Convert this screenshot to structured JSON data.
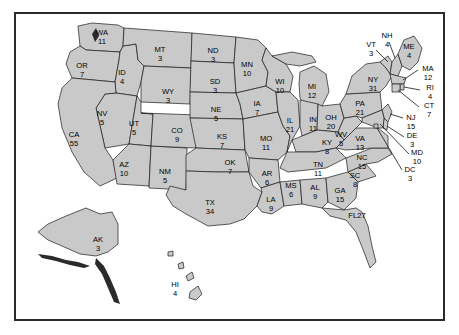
{
  "figure": {
    "frame_color": "#2b2b2b",
    "state_fill_color": "#c9c9c9",
    "state_border_color": "#1a1a1a",
    "background_color": "#ffffff",
    "label_color": "#000000"
  },
  "chart_data": {
    "type": "map",
    "value_label": "Electoral votes",
    "total_electoral_votes": 538,
    "categories": [
      "WA",
      "OR",
      "ID",
      "MT",
      "WY",
      "NV",
      "UT",
      "CA",
      "AZ",
      "NM",
      "CO",
      "ND",
      "SD",
      "NE",
      "KS",
      "OK",
      "TX",
      "MN",
      "IA",
      "MO",
      "AR",
      "LA",
      "WI",
      "IL",
      "MS",
      "AL",
      "MI",
      "IN",
      "OH",
      "KY",
      "TN",
      "GA",
      "FL",
      "SC",
      "NC",
      "VA",
      "WV",
      "PA",
      "NY",
      "VT",
      "NH",
      "ME",
      "MA",
      "RI",
      "CT",
      "NJ",
      "DE",
      "MD",
      "DC",
      "AK",
      "HI"
    ],
    "values": [
      11,
      7,
      4,
      3,
      3,
      5,
      5,
      55,
      10,
      5,
      9,
      3,
      3,
      5,
      7,
      7,
      34,
      10,
      7,
      11,
      6,
      9,
      10,
      21,
      6,
      9,
      12,
      11,
      20,
      8,
      11,
      15,
      27,
      8,
      15,
      13,
      5,
      21,
      31,
      3,
      4,
      4,
      12,
      4,
      7,
      15,
      3,
      10,
      3,
      3,
      4
    ],
    "states": [
      {
        "abbr": "WA",
        "votes": 11,
        "label_x": 102,
        "label_y": 33,
        "leader": false
      },
      {
        "abbr": "OR",
        "votes": 7,
        "label_x": 82,
        "label_y": 66,
        "leader": false
      },
      {
        "abbr": "ID",
        "votes": 4,
        "label_x": 122,
        "label_y": 73,
        "leader": false
      },
      {
        "abbr": "MT",
        "votes": 3,
        "label_x": 160,
        "label_y": 50,
        "leader": false
      },
      {
        "abbr": "WY",
        "votes": 3,
        "label_x": 168,
        "label_y": 92,
        "leader": false
      },
      {
        "abbr": "NV",
        "votes": 5,
        "label_x": 102,
        "label_y": 114,
        "leader": false
      },
      {
        "abbr": "UT",
        "votes": 5,
        "label_x": 134,
        "label_y": 124,
        "leader": false
      },
      {
        "abbr": "CA",
        "votes": 55,
        "label_x": 74,
        "label_y": 135,
        "leader": false
      },
      {
        "abbr": "AZ",
        "votes": 10,
        "label_x": 124,
        "label_y": 165,
        "leader": false
      },
      {
        "abbr": "NM",
        "votes": 5,
        "label_x": 165,
        "label_y": 172,
        "leader": false
      },
      {
        "abbr": "CO",
        "votes": 9,
        "label_x": 177,
        "label_y": 131,
        "leader": false
      },
      {
        "abbr": "ND",
        "votes": 3,
        "label_x": 213,
        "label_y": 51,
        "leader": false
      },
      {
        "abbr": "SD",
        "votes": 3,
        "label_x": 215,
        "label_y": 82,
        "leader": false
      },
      {
        "abbr": "NE",
        "votes": 5,
        "label_x": 216,
        "label_y": 110,
        "leader": false
      },
      {
        "abbr": "KS",
        "votes": 7,
        "label_x": 222,
        "label_y": 137,
        "leader": false
      },
      {
        "abbr": "OK",
        "votes": 7,
        "label_x": 230,
        "label_y": 163,
        "leader": false
      },
      {
        "abbr": "TX",
        "votes": 34,
        "label_x": 210,
        "label_y": 203,
        "leader": false
      },
      {
        "abbr": "MN",
        "votes": 10,
        "label_x": 247,
        "label_y": 65,
        "leader": false
      },
      {
        "abbr": "IA",
        "votes": 7,
        "label_x": 257,
        "label_y": 104,
        "leader": false
      },
      {
        "abbr": "MO",
        "votes": 11,
        "label_x": 266,
        "label_y": 139,
        "leader": false
      },
      {
        "abbr": "AR",
        "votes": 6,
        "label_x": 267,
        "label_y": 174,
        "leader": false
      },
      {
        "abbr": "LA",
        "votes": 9,
        "label_x": 271,
        "label_y": 200,
        "leader": false
      },
      {
        "abbr": "WI",
        "votes": 10,
        "label_x": 280,
        "label_y": 82,
        "leader": false
      },
      {
        "abbr": "IL",
        "votes": 21,
        "label_x": 290,
        "label_y": 121,
        "leader": false
      },
      {
        "abbr": "MS",
        "votes": 6,
        "label_x": 291,
        "label_y": 186,
        "leader": false
      },
      {
        "abbr": "AL",
        "votes": 9,
        "label_x": 315,
        "label_y": 188,
        "leader": false
      },
      {
        "abbr": "MI",
        "votes": 12,
        "label_x": 312,
        "label_y": 87,
        "leader": false
      },
      {
        "abbr": "IN",
        "votes": 11,
        "label_x": 313,
        "label_y": 120,
        "leader": false
      },
      {
        "abbr": "OH",
        "votes": 20,
        "label_x": 331,
        "label_y": 118,
        "leader": false
      },
      {
        "abbr": "KY",
        "votes": 8,
        "label_x": 327,
        "label_y": 143,
        "leader": false
      },
      {
        "abbr": "TN",
        "votes": 11,
        "label_x": 318,
        "label_y": 165,
        "leader": false
      },
      {
        "abbr": "GA",
        "votes": 15,
        "label_x": 340,
        "label_y": 191,
        "leader": false
      },
      {
        "abbr": "FL",
        "votes": 27,
        "label_x": 357,
        "label_y": 216,
        "leader": false,
        "inline": true
      },
      {
        "abbr": "SC",
        "votes": 8,
        "label_x": 355,
        "label_y": 176,
        "leader": false
      },
      {
        "abbr": "NC",
        "votes": 15,
        "label_x": 362,
        "label_y": 158,
        "leader": false
      },
      {
        "abbr": "VA",
        "votes": 13,
        "label_x": 360,
        "label_y": 139,
        "leader": false
      },
      {
        "abbr": "WV",
        "votes": 5,
        "label_x": 341,
        "label_y": 135,
        "leader": false
      },
      {
        "abbr": "PA",
        "votes": 21,
        "label_x": 360,
        "label_y": 104,
        "leader": false
      },
      {
        "abbr": "NY",
        "votes": 31,
        "label_x": 373,
        "label_y": 80,
        "leader": false
      },
      {
        "abbr": "VT",
        "votes": 3,
        "label_x": 371,
        "label_y": 45,
        "leader": true
      },
      {
        "abbr": "NH",
        "votes": 4,
        "label_x": 387,
        "label_y": 36,
        "leader": true
      },
      {
        "abbr": "ME",
        "votes": 4,
        "label_x": 409,
        "label_y": 47,
        "leader": false
      },
      {
        "abbr": "MA",
        "votes": 12,
        "label_x": 428,
        "label_y": 69,
        "leader": true
      },
      {
        "abbr": "RI",
        "votes": 4,
        "label_x": 430,
        "label_y": 88,
        "leader": true
      },
      {
        "abbr": "CT",
        "votes": 7,
        "label_x": 429,
        "label_y": 106,
        "leader": true
      },
      {
        "abbr": "NJ",
        "votes": 15,
        "label_x": 411,
        "label_y": 118,
        "leader": true
      },
      {
        "abbr": "DE",
        "votes": 3,
        "label_x": 412,
        "label_y": 136,
        "leader": true
      },
      {
        "abbr": "MD",
        "votes": 10,
        "label_x": 417,
        "label_y": 153,
        "leader": true
      },
      {
        "abbr": "DC",
        "votes": 3,
        "label_x": 410,
        "label_y": 170,
        "leader": true
      },
      {
        "abbr": "AK",
        "votes": 3,
        "label_x": 98,
        "label_y": 240,
        "leader": false
      },
      {
        "abbr": "HI",
        "votes": 4,
        "label_x": 175,
        "label_y": 285,
        "leader": false
      }
    ]
  }
}
